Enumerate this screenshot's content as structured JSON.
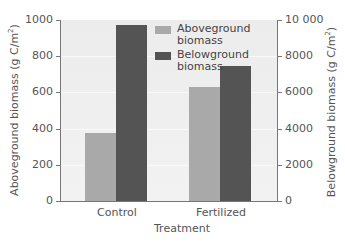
{
  "chart_data": {
    "type": "bar",
    "title": "",
    "xlabel": "Treatment",
    "categories": [
      "Control",
      "Fertilized"
    ],
    "series": [
      {
        "name": "Aboveground biomass",
        "axis": "left",
        "color": "#a9a9a9",
        "values": [
          375,
          630
        ]
      },
      {
        "name": "Belowground biomass",
        "axis": "right",
        "color": "#545454",
        "values": [
          9700,
          7450
        ]
      }
    ],
    "ylabel_left": "Aboveground biomass (g C/m2)",
    "ylabel_right": "Belowground biomass (g C/m2)",
    "ylim_left": [
      0,
      1000
    ],
    "ylim_right": [
      0,
      10000
    ],
    "yticks_left": [
      "0",
      "200",
      "400",
      "600",
      "800",
      "1000"
    ],
    "yticks_right": [
      "0",
      "2000",
      "4000",
      "6000",
      "8000",
      "10 000"
    ],
    "legend_position": "upper center",
    "grid": true
  },
  "labels": {
    "ylabel_left_text": "Aboveground biomass (g C/m",
    "ylabel_right_text": "Belowground biomass (g C/m",
    "sup": "2",
    "ylabel_close": ")",
    "legend_above_line1": "Aboveground",
    "legend_above_line2": "biomass",
    "legend_below_line1": "Belowground",
    "legend_below_line2": "biomass"
  }
}
